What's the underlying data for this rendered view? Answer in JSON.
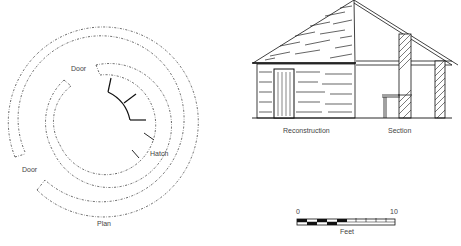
{
  "plan": {
    "caption": "Plan",
    "labels": {
      "door_top": "Door",
      "door_left": "Door",
      "hatch": "Hatch"
    }
  },
  "elevation": {
    "reconstruction_caption": "Reconstruction",
    "section_caption": "Section"
  },
  "scale_bar": {
    "min_label": "0",
    "max_label": "10",
    "unit_label": "Feet"
  },
  "colors": {
    "ink": "#1a1a1a",
    "label": "#444444",
    "background": "#ffffff"
  }
}
